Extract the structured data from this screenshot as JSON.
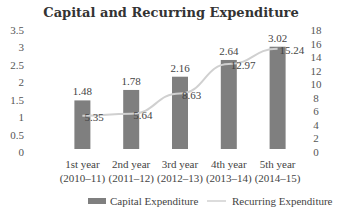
{
  "chart_data": {
    "type": "bar",
    "title": "Capital and Recurring Expenditure",
    "categories": [
      [
        "1st year",
        "(2010–11)"
      ],
      [
        "2nd year",
        "(2011–12)"
      ],
      [
        "3rd year",
        "(2012–13)"
      ],
      [
        "4th year",
        "(2013–14)"
      ],
      [
        "5th year",
        "(2014–15)"
      ]
    ],
    "series": [
      {
        "name": "Capital Expenditure",
        "type": "bar",
        "axis": "left",
        "values": [
          1.48,
          1.78,
          2.16,
          2.64,
          3.02
        ],
        "labels": [
          "1.48",
          "1.78",
          "2.16",
          "2.64",
          "3.02"
        ],
        "color": "#7f7f7f"
      },
      {
        "name": "Recurring Expenditure",
        "type": "line",
        "axis": "right",
        "values": [
          5.35,
          5.64,
          8.63,
          12.97,
          15.24
        ],
        "labels": [
          "5.35",
          "5.64",
          "8.63",
          "12.97",
          "15.24"
        ],
        "color": "#d0d0d0"
      }
    ],
    "y_left": {
      "range": [
        0,
        3.5
      ],
      "ticks": [
        "0",
        "0.5",
        "1",
        "1.5",
        "2",
        "2.5",
        "3",
        "3.5"
      ]
    },
    "y_right": {
      "range": [
        0,
        18
      ],
      "ticks": [
        "0",
        "2",
        "4",
        "6",
        "8",
        "10",
        "12",
        "14",
        "16",
        "18"
      ]
    },
    "grid": false,
    "legend": "bottom"
  }
}
